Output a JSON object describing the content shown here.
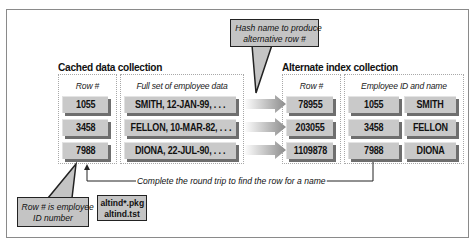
{
  "diagram": {
    "cached_collection": {
      "title": "Cached data collection",
      "row_column": {
        "header": "Row #",
        "rows": [
          "1055",
          "3458",
          "7988"
        ]
      },
      "data_column": {
        "header": "Full set of employee data",
        "rows": [
          "SMITH, 12-JAN-99, . . .",
          "FELLON, 10-MAR-82, . . .",
          "DIONA, 22-JUL-90, . . ."
        ]
      }
    },
    "alternate_collection": {
      "title": "Alternate index collection",
      "row_column": {
        "header": "Row #",
        "rows": [
          "78955",
          "203055",
          "1109878"
        ]
      },
      "id_name_column": {
        "header": "Employee ID and name",
        "ids": [
          "1055",
          "3458",
          "7988"
        ],
        "names": [
          "SMITH",
          "FELLON",
          "DIONA"
        ]
      }
    },
    "callouts": {
      "hash": [
        "Hash name to produce",
        "alternative row #"
      ],
      "row_id": [
        "Row # is employee",
        "ID number"
      ]
    },
    "round_trip_label": "Complete the round trip to find the row for a name",
    "files": [
      "altind*.pkg",
      "altind.tst"
    ],
    "colors": {
      "block_fill": "#c9c9c9",
      "block_shadow": "#6e6e6e",
      "callout_fill": "#c4c4c4",
      "frame": "#8a8a8a"
    }
  }
}
